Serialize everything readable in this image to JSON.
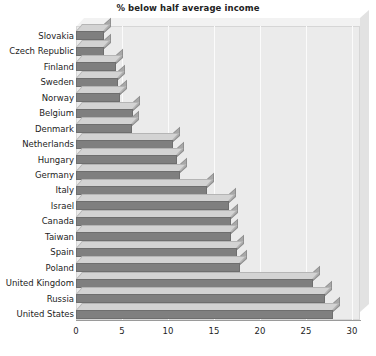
{
  "chart_data": {
    "type": "bar",
    "orientation": "horizontal",
    "title": "% below half average income",
    "xlabel": "",
    "ylabel": "",
    "xlim": [
      0,
      30
    ],
    "xticks": [
      0,
      5,
      10,
      15,
      20,
      25,
      30
    ],
    "grid": true,
    "legend": null,
    "style": "3d-bars-gray",
    "categories": [
      "Slovakia",
      "Czech Republic",
      "Finland",
      "Sweden",
      "Norway",
      "Belgium",
      "Denmark",
      "Netherlands",
      "Hungary",
      "Germany",
      "Italy",
      "Israel",
      "Canada",
      "Taiwan",
      "Spain",
      "Poland",
      "United Kingdom",
      "Russia",
      "United States"
    ],
    "values": [
      3.0,
      3.0,
      4.3,
      4.6,
      4.8,
      6.2,
      6.1,
      10.5,
      11.0,
      11.3,
      14.2,
      16.6,
      16.8,
      16.8,
      17.5,
      17.8,
      25.8,
      27.1,
      27.9
    ]
  },
  "colors": {
    "bar_front": "#7f7f7f",
    "bar_top": "#d3d3d3",
    "bar_side": "#a8a8a8",
    "plot_background": "#ebebeb",
    "gridline": "#fbfbfb",
    "axis": "#9a9a9a",
    "text": "#1d1d1d"
  }
}
